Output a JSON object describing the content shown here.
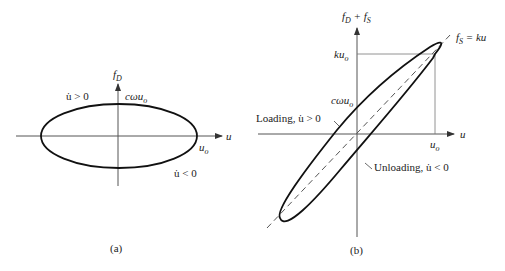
{
  "panel_a": {
    "caption": "(a)",
    "y_axis_label": {
      "main": "f",
      "sub": "D"
    },
    "x_axis_label": "u",
    "peak_label": {
      "main": "cωu",
      "sub": "o"
    },
    "x_intercept_label": {
      "main": "u",
      "sub": "o"
    },
    "upper_branch_label": "u̇ > 0",
    "lower_branch_label": "u̇ < 0"
  },
  "panel_b": {
    "caption": "(b)",
    "y_axis_label": {
      "f1": "f",
      "s1": "D",
      "plus": " + ",
      "f2": "f",
      "s2": "S"
    },
    "x_axis_label": "u",
    "spring_line_label": {
      "f": "f",
      "s": "S",
      "rest": " = ku"
    },
    "max_force_label": {
      "main": "ku",
      "sub": "o"
    },
    "y_intercept_label": {
      "main": "cωu",
      "sub": "o"
    },
    "x_tick_label": {
      "main": "u",
      "sub": "o"
    },
    "loading_label": "Loading, u̇ > 0",
    "unloading_label": "Unloading, u̇ < 0"
  }
}
